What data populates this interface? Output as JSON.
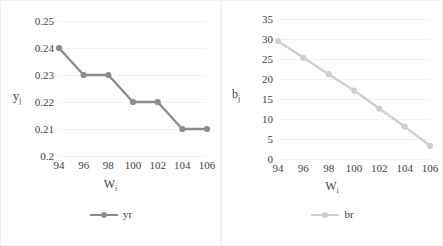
{
  "chart_data": [
    {
      "type": "line",
      "title": "",
      "xlabel": "W",
      "xlabel_sub": "i",
      "ylabel": "y",
      "ylabel_sub": "j",
      "x": [
        94,
        96,
        98,
        100,
        102,
        104,
        106
      ],
      "xticklabels": [
        "94",
        "96",
        "98",
        "100",
        "102",
        "104",
        "106"
      ],
      "yticklabels": [
        "0.2",
        "0.21",
        "0.22",
        "0.23",
        "0.24",
        "0.25"
      ],
      "ylim": [
        0.2,
        0.25
      ],
      "ytick_values": [
        0.2,
        0.21,
        0.22,
        0.23,
        0.24,
        0.25
      ],
      "grid": true,
      "legend_position": "bottom",
      "series": [
        {
          "name": "yr",
          "color": "#8c8c8c",
          "marker": "circle",
          "values": [
            0.24,
            0.23,
            0.23,
            0.22,
            0.22,
            0.21,
            0.21
          ]
        }
      ]
    },
    {
      "type": "line",
      "title": "",
      "xlabel": "W",
      "xlabel_sub": "i",
      "ylabel": "b",
      "ylabel_sub": "j",
      "x": [
        94,
        96,
        98,
        100,
        102,
        104,
        106
      ],
      "xticklabels": [
        "94",
        "96",
        "98",
        "100",
        "102",
        "104",
        "106"
      ],
      "yticklabels": [
        "0",
        "5",
        "10",
        "15",
        "20",
        "25",
        "30",
        "35"
      ],
      "ylim": [
        0,
        35
      ],
      "ytick_values": [
        0,
        5,
        10,
        15,
        20,
        25,
        30,
        35
      ],
      "grid": true,
      "legend_position": "bottom",
      "series": [
        {
          "name": "br",
          "color": "#cfcfcf",
          "marker": "circle",
          "values": [
            29.5,
            25.3,
            21.2,
            17.1,
            12.6,
            8.1,
            3.3
          ]
        }
      ]
    }
  ],
  "left_chart": {
    "ylabel": "y",
    "ylabel_sub": "j",
    "xlabel": "W",
    "xlabel_sub": "i",
    "legend_label": "yr"
  },
  "right_chart": {
    "ylabel": "b",
    "ylabel_sub": "j",
    "xlabel": "W",
    "xlabel_sub": "i",
    "legend_label": "br"
  }
}
